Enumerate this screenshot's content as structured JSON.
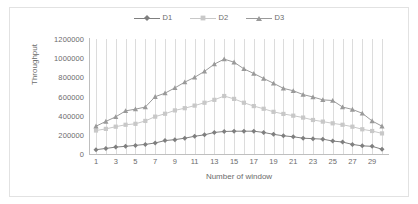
{
  "chart_data": {
    "type": "line",
    "title": "",
    "xlabel": "Number of window",
    "ylabel": "Throughput",
    "x": [
      1,
      2,
      3,
      4,
      5,
      6,
      7,
      8,
      9,
      10,
      11,
      12,
      13,
      14,
      15,
      16,
      17,
      18,
      19,
      20,
      21,
      22,
      23,
      24,
      25,
      26,
      27,
      28,
      29,
      30
    ],
    "xtick_labels": [
      "1",
      "3",
      "5",
      "7",
      "9",
      "11",
      "13",
      "15",
      "17",
      "19",
      "21",
      "23",
      "25",
      "27",
      "29"
    ],
    "ytick_labels": [
      "0",
      "200000",
      "400000",
      "600000",
      "800000",
      "1000000",
      "1200000"
    ],
    "ytick_values": [
      0,
      200000,
      400000,
      600000,
      800000,
      1000000,
      1200000
    ],
    "ylim": [
      0,
      1200000
    ],
    "xlim": [
      1,
      30
    ],
    "grid": "vertical",
    "legend_position": "top-center",
    "series": [
      {
        "name": "D1",
        "color": "#7f7f7f",
        "marker": "diamond",
        "values": [
          45000,
          58000,
          72000,
          80000,
          90000,
          100000,
          115000,
          140000,
          150000,
          165000,
          185000,
          200000,
          225000,
          235000,
          238000,
          238000,
          238000,
          225000,
          205000,
          190000,
          180000,
          165000,
          160000,
          155000,
          135000,
          125000,
          100000,
          85000,
          80000,
          50000
        ]
      },
      {
        "name": "D2",
        "color": "#c8c8c8",
        "marker": "square",
        "values": [
          245000,
          262000,
          285000,
          305000,
          315000,
          345000,
          390000,
          420000,
          455000,
          478000,
          505000,
          535000,
          565000,
          605000,
          575000,
          535000,
          500000,
          472000,
          440000,
          418000,
          400000,
          380000,
          355000,
          338000,
          320000,
          305000,
          285000,
          258000,
          240000,
          215000
        ]
      },
      {
        "name": "D3",
        "color": "#9a9a9a",
        "marker": "triangle",
        "values": [
          290000,
          340000,
          388000,
          450000,
          468000,
          490000,
          598000,
          635000,
          690000,
          750000,
          800000,
          862000,
          938000,
          990000,
          958000,
          888000,
          840000,
          788000,
          738000,
          685000,
          660000,
          620000,
          595000,
          565000,
          558000,
          490000,
          465000,
          425000,
          345000,
          290000
        ]
      }
    ]
  },
  "legend": {
    "items": [
      {
        "label": "D1"
      },
      {
        "label": "D2"
      },
      {
        "label": "D3"
      }
    ]
  }
}
